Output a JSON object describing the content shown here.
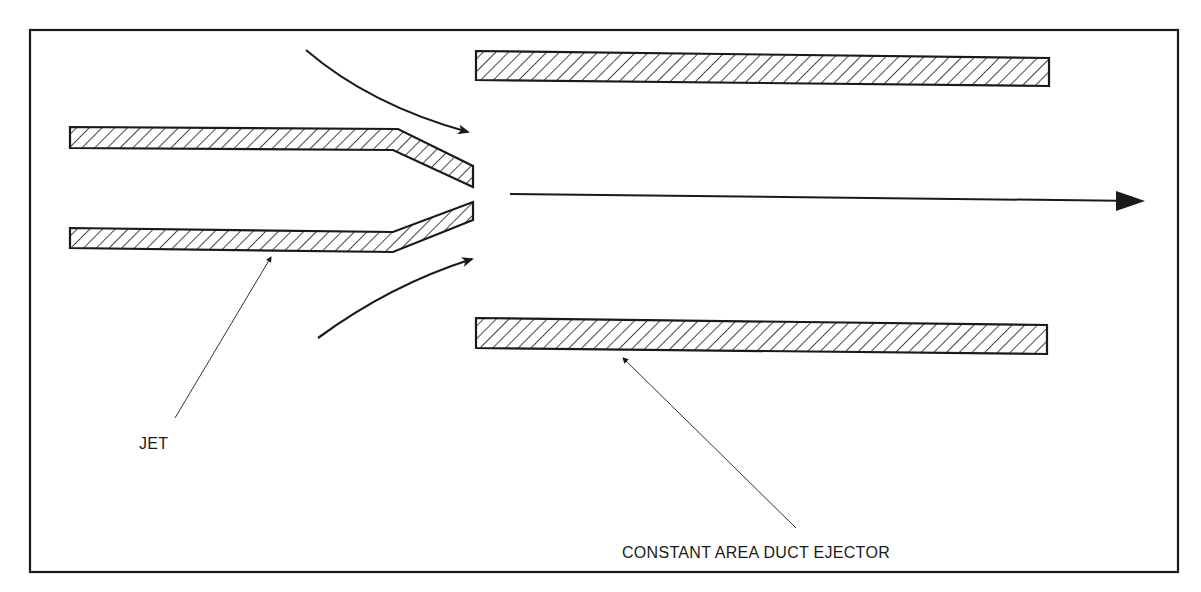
{
  "diagram": {
    "type": "schematic",
    "colors": {
      "line": "#1a1a1a",
      "background": "#ffffff",
      "hatch": "#1a1a1a"
    },
    "labels": {
      "jet": "JET",
      "duct": "CONSTANT AREA DUCT EJECTOR"
    },
    "components": [
      {
        "id": "jet-nozzle-upper-wall",
        "kind": "hatched-wall",
        "description": "Upper wall of converging jet nozzle"
      },
      {
        "id": "jet-nozzle-lower-wall",
        "kind": "hatched-wall",
        "description": "Lower wall of converging jet nozzle"
      },
      {
        "id": "duct-upper-wall",
        "kind": "hatched-wall",
        "description": "Upper wall of constant area duct"
      },
      {
        "id": "duct-lower-wall",
        "kind": "hatched-wall",
        "description": "Lower wall of constant area duct"
      },
      {
        "id": "entrained-flow-upper-arrow",
        "kind": "curved-arrow",
        "description": "Secondary flow entrained from above"
      },
      {
        "id": "entrained-flow-lower-arrow",
        "kind": "curved-arrow",
        "description": "Secondary flow entrained from below"
      },
      {
        "id": "main-flow-arrow",
        "kind": "straight-arrow",
        "description": "Mixed flow exiting to the right"
      }
    ],
    "leaders": [
      {
        "label": "jet",
        "points_to": "jet-nozzle-lower-wall"
      },
      {
        "label": "duct",
        "points_to": "duct-lower-wall"
      }
    ]
  }
}
